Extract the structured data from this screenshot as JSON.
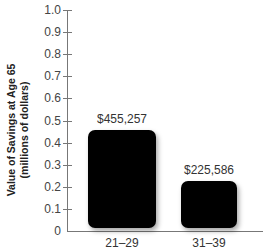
{
  "chart_data": {
    "type": "bar",
    "title": "",
    "xlabel": "",
    "ylabel": "Value of Savings at Age 65 (millions of dollars)",
    "ylabel_lines": [
      "Value of Savings at Age 65",
      "(millions of dollars)"
    ],
    "categories": [
      "21–29",
      "31–39"
    ],
    "values": [
      0.455257,
      0.225586
    ],
    "data_labels": [
      "$455,257",
      "$225,586"
    ],
    "ylim": [
      0,
      1.0
    ],
    "yticks": [
      "0",
      "0.1",
      "0.2",
      "0.3",
      "0.4",
      "0.5",
      "0.6",
      "0.7",
      "0.8",
      "0.9",
      "1.0"
    ],
    "grid": false,
    "legend": null,
    "bar_color": "#000000"
  }
}
